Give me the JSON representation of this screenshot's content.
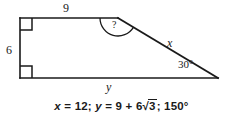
{
  "figure": {
    "type": "geometry-diagram",
    "background_color": "#ffffff",
    "stroke_color": "#1a1a1a",
    "vertices": {
      "top_left": [
        20,
        18
      ],
      "top_right": [
        118,
        18
      ],
      "bottom_right": [
        218,
        78
      ],
      "bottom_left": [
        20,
        78
      ]
    },
    "sides": [
      {
        "name": "top",
        "label": "9",
        "from": "top_left",
        "to": "top_right"
      },
      {
        "name": "left",
        "label": "6",
        "from": "top_left",
        "to": "bottom_left"
      },
      {
        "name": "bottom",
        "label": "y",
        "from": "bottom_left",
        "to": "bottom_right"
      },
      {
        "name": "hypotenuse",
        "label": "x",
        "from": "top_right",
        "to": "bottom_right"
      }
    ],
    "angles": [
      {
        "name": "top-left",
        "marker": "right-angle-square",
        "label": ""
      },
      {
        "name": "bottom-left",
        "marker": "right-angle-square",
        "label": ""
      },
      {
        "name": "top-right",
        "marker": "arc",
        "label": "?"
      },
      {
        "name": "bottom-right",
        "marker": "none",
        "label": "30°"
      }
    ],
    "labels": {
      "side_top": "9",
      "side_left": "6",
      "side_bottom": "y",
      "side_hypotenuse": "x",
      "angle_right": "30°",
      "angle_unknown": "?"
    }
  },
  "caption": {
    "full_text": "x = 12; y = 9 + 6√3; 150°",
    "part_x_var": "x",
    "part_x_eq": " = 12; ",
    "part_y_var": "y",
    "part_y_eq": " = 9 + 6",
    "radical_symbol": "√",
    "radicand": "3",
    "part_tail": "; 150°"
  }
}
